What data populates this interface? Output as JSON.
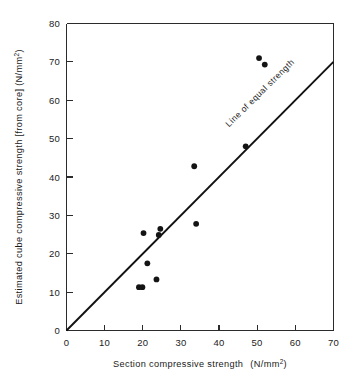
{
  "chart_data": {
    "type": "scatter",
    "title": "",
    "xlabel": "Section compressive strength  (N/mm2)",
    "xlabel_main": "Section compressive strength",
    "xlabel_units_prefix": "(N/mm",
    "xlabel_units_sup": "2",
    "xlabel_units_suffix": ")",
    "ylabel": "Estimated cube compressive strength [from core] (N/mm2)",
    "ylabel_main": "Estimated cube compressive strength [from core] (N/mm",
    "ylabel_units_sup": "2",
    "ylabel_units_suffix": ")",
    "xlim": [
      0,
      70
    ],
    "ylim": [
      0,
      80
    ],
    "xticks": [
      0,
      10,
      20,
      30,
      40,
      50,
      60,
      70
    ],
    "yticks": [
      0,
      10,
      20,
      30,
      40,
      50,
      60,
      70,
      80
    ],
    "xtick_labels": [
      "0",
      "10",
      "20",
      "30",
      "40",
      "50",
      "60",
      "70"
    ],
    "ytick_labels": [
      "0",
      "10",
      "20",
      "30",
      "40",
      "50",
      "60",
      "70",
      "80"
    ],
    "grid": false,
    "legend": null,
    "series": [
      {
        "name": "Core vs section strength",
        "marker": "filled-circle",
        "color": "#141414",
        "points": [
          {
            "x": 19.0,
            "y": 11.3
          },
          {
            "x": 19.9,
            "y": 11.3
          },
          {
            "x": 20.2,
            "y": 25.4
          },
          {
            "x": 21.2,
            "y": 17.5
          },
          {
            "x": 23.6,
            "y": 13.3
          },
          {
            "x": 24.2,
            "y": 24.9
          },
          {
            "x": 24.6,
            "y": 26.5
          },
          {
            "x": 33.5,
            "y": 42.8
          },
          {
            "x": 34.0,
            "y": 27.8
          },
          {
            "x": 47.0,
            "y": 48.0
          },
          {
            "x": 50.5,
            "y": 71.0
          },
          {
            "x": 52.0,
            "y": 69.3
          }
        ]
      }
    ],
    "reference_line": {
      "label": "Line of equal strength",
      "type": "identity",
      "from": [
        0,
        0
      ],
      "to": [
        70,
        70
      ],
      "color": "#111111"
    }
  },
  "annotations": {
    "equal_strength_label": "Line of equal strength"
  }
}
